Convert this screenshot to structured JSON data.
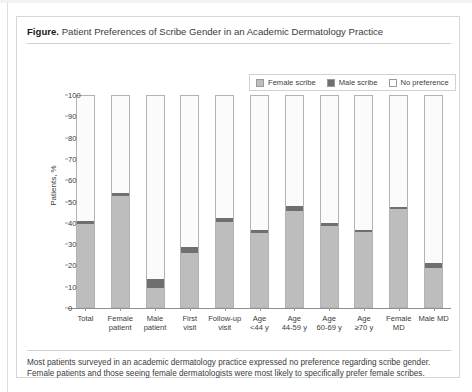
{
  "figure": {
    "label": "Figure.",
    "title": "Patient Preferences of Scribe Gender in an Academic Dermatology Practice",
    "caption_line1": "Most patients surveyed in an academic dermatology practice expressed no preference regarding scribe gender.",
    "caption_line2": "Female patients and those seeing female dermatologists were most likely to specifically prefer female scribes."
  },
  "colors": {
    "female_scribe": "#bdbdbd",
    "male_scribe": "#6f6f6f",
    "no_preference": "#fbfbfb",
    "axis": "#8f8f8f",
    "border": "#d6d6d6"
  },
  "legend": {
    "position": "top-right",
    "items": [
      {
        "label": "Female scribe",
        "swatch": "#bdbdbd"
      },
      {
        "label": "Male scribe",
        "swatch": "#6f6f6f"
      },
      {
        "label": "No preference",
        "swatch": "#ffffff"
      }
    ]
  },
  "chart_data": {
    "type": "bar",
    "subtype": "stacked-percent",
    "title": "Patient Preferences of Scribe Gender in an Academic Dermatology Practice",
    "xlabel": "",
    "ylabel": "Patients, %",
    "ylim": [
      0,
      100
    ],
    "yticks": [
      0,
      10,
      20,
      30,
      40,
      50,
      60,
      70,
      80,
      90,
      100
    ],
    "ytick_labels": [
      "0",
      "10",
      "20",
      "30",
      "40",
      "50",
      "60",
      "70",
      "80",
      "90",
      "100"
    ],
    "grid": false,
    "legend_position": "top-right",
    "categories": [
      "Total",
      "Female patient",
      "Male patient",
      "First visit",
      "Follow-up visit",
      "Age <44 y",
      "Age 44-59 y",
      "Age 60-69 y",
      "Age ≥70 y",
      "Female MD",
      "Male MD"
    ],
    "category_lines": [
      [
        "Total"
      ],
      [
        "Female",
        "patient"
      ],
      [
        "Male",
        "patient"
      ],
      [
        "First",
        "visit"
      ],
      [
        "Follow-up",
        "visit"
      ],
      [
        "Age",
        "<44 y"
      ],
      [
        "Age",
        "44-59 y"
      ],
      [
        "Age",
        "60-69 y"
      ],
      [
        "Age",
        "≥70 y"
      ],
      [
        "Female",
        "MD"
      ],
      [
        "Male MD"
      ]
    ],
    "series": [
      {
        "name": "Female scribe",
        "color": "#bdbdbd",
        "values": [
          39.5,
          52.5,
          9.0,
          25.5,
          40.5,
          35.0,
          45.5,
          38.5,
          35.5,
          46.5,
          18.5
        ]
      },
      {
        "name": "Male scribe",
        "color": "#6f6f6f",
        "values": [
          1.5,
          1.5,
          4.5,
          3.0,
          1.5,
          1.5,
          2.5,
          1.5,
          1.0,
          1.0,
          2.5
        ]
      },
      {
        "name": "No preference",
        "color": "#ffffff",
        "values": [
          59.0,
          46.0,
          86.5,
          71.5,
          58.0,
          63.5,
          52.0,
          60.0,
          63.5,
          52.5,
          79.0
        ]
      }
    ]
  }
}
